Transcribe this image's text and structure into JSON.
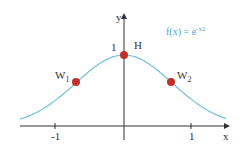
{
  "diagram": {
    "function_label": "f(x) = e",
    "function_exponent": "-x",
    "function_exponent_power": "2",
    "axis_x_label": "x",
    "axis_y_label": "y",
    "tick_neg1": "-1",
    "tick_pos1": "1",
    "y_tick_1": "1",
    "points": [
      {
        "name": "H",
        "x": 0,
        "y": 1
      },
      {
        "name": "W",
        "sub": "1",
        "x": -0.707,
        "y": 0.607
      },
      {
        "name": "W",
        "sub": "2",
        "x": 0.707,
        "y": 0.607
      }
    ],
    "colors": {
      "curve": "#6fc0e0",
      "points": "#c0302a",
      "axes": "#333333"
    }
  }
}
